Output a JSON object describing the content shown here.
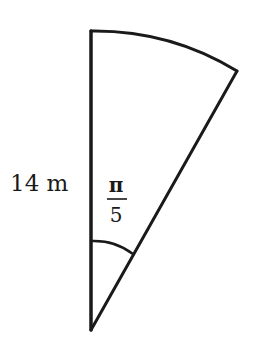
{
  "diagram": {
    "type": "circular-sector",
    "radius_label": "14 m",
    "angle_label": {
      "numerator": "π",
      "denominator": "5"
    },
    "colors": {
      "stroke": "#1a1a1a",
      "background": "#ffffff"
    }
  }
}
